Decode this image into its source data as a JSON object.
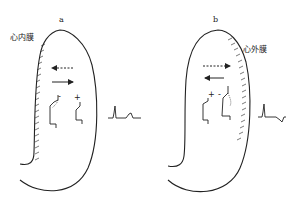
{
  "panels": [
    {
      "id": "a",
      "label": "a",
      "layer_label": "心内膜",
      "layer_meaning": "endocardium",
      "hatched_side": "left (inner wall)",
      "arrows": [
        {
          "style": "dashed",
          "direction": "left"
        },
        {
          "style": "solid",
          "direction": "right"
        }
      ],
      "signs": [
        "-",
        "+"
      ],
      "ecg_waveform": "upright QRS followed by upright T wave"
    },
    {
      "id": "b",
      "label": "b",
      "layer_label": "心外膜",
      "layer_meaning": "epicardium",
      "hatched_side": "right (outer wall)",
      "arrows": [
        {
          "style": "dashed",
          "direction": "right"
        },
        {
          "style": "solid",
          "direction": "left"
        }
      ],
      "signs": [
        "+",
        "-"
      ],
      "ecg_waveform": "upright QRS followed by inverted T wave"
    }
  ],
  "colors": {
    "line": "#222222",
    "background": "#ffffff"
  }
}
